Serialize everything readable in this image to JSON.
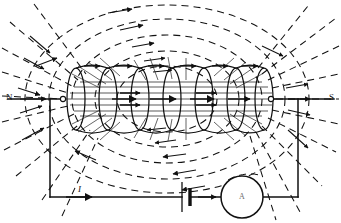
{
  "figure": {
    "kind": "physics-diagram",
    "background_color": "#ffffff",
    "ink_color": "#111111"
  },
  "labels": {
    "north_pole": "N",
    "south_pole": "S",
    "current": "I",
    "ammeter": "A"
  },
  "components": {
    "solenoid": {
      "name": "solenoid-coil",
      "turns": 7,
      "left_terminal_x": 62,
      "right_terminal_x": 272,
      "axis_y": 99,
      "loop_rx": 9,
      "loop_ry": 31
    },
    "battery": {
      "name": "battery-cell",
      "x": 186,
      "y": 197
    },
    "ammeter": {
      "name": "ammeter",
      "cx": 242,
      "cy": 197,
      "r": 21
    },
    "circuit": {
      "left_x": 50,
      "right_x": 298,
      "top_y": 99,
      "bottom_y": 197
    }
  },
  "field": {
    "style": "dashed",
    "outer_loops": 5,
    "top_arrow_direction": "right",
    "bottom_arrow_direction": "left",
    "axis_arrow_direction": "right",
    "dash_pattern": "7 5"
  }
}
